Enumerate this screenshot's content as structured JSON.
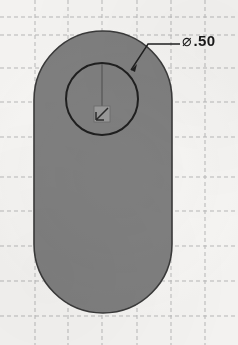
{
  "drawing": {
    "title": "Slot part sketch with hole",
    "background_color": "#f7f6f4",
    "grid": {
      "visible": true,
      "style": "dashed",
      "color": "#b9b9b9",
      "spacing_px": 34,
      "vertical_lines_x": [
        35,
        68,
        102,
        137,
        171,
        205
      ],
      "horizontal_lines_y": [
        17,
        35,
        68,
        102,
        137,
        177,
        211,
        246,
        281,
        316
      ]
    },
    "shapes": {
      "slot": {
        "name": "obround-slot-body",
        "fill_color": "#808080",
        "stroke_color": "#3a3a3a",
        "x": 34,
        "y": 31,
        "width": 138,
        "height": 282,
        "corner_radius": 69
      },
      "hole": {
        "name": "through-hole-circle",
        "stroke_color": "#1f1f1f",
        "center_x": 102,
        "center_y": 99,
        "radius": 36,
        "fill": "none"
      },
      "origin_marker": {
        "name": "sketch-origin",
        "x": 102,
        "y": 114,
        "color": "#4d4d4d"
      },
      "centerline": {
        "name": "vertical-centerline",
        "from_x": 102,
        "from_y": 64,
        "to_x": 102,
        "to_y": 114,
        "color": "#5a5a5a"
      }
    },
    "dimension": {
      "name": "hole-diameter",
      "symbol": "⌀",
      "value": ".50",
      "full_text": "⌀.50",
      "text_color": "#1a1a1a",
      "leader": {
        "color": "#1f1f1f",
        "arrow_x": 131,
        "arrow_y": 70,
        "elbow_x": 148,
        "elbow_y": 44,
        "end_x": 180,
        "end_y": 44
      }
    }
  }
}
